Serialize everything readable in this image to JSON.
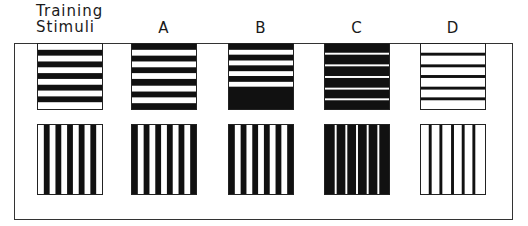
{
  "figure": {
    "column_labels": [
      {
        "id": "training",
        "line1": "Training",
        "line2": "Stimuli"
      },
      {
        "id": "A",
        "text": "A"
      },
      {
        "id": "B",
        "text": "B"
      },
      {
        "id": "C",
        "text": "C"
      },
      {
        "id": "D",
        "text": "D"
      }
    ],
    "rows": [
      "horizontal gratings",
      "vertical gratings"
    ],
    "stimuli": [
      {
        "column": "Training Stimuli",
        "description": "equal-width black/white bars (square wave)",
        "bar_width_ratio_black": 0.5,
        "cycles": 5,
        "horizontal_first_stripe": "white"
      },
      {
        "column": "A",
        "description": "equal bars, phase shifted (starts black)",
        "bar_width_ratio_black": 0.5,
        "cycles": 5,
        "horizontal_first_stripe": "black"
      },
      {
        "column": "B",
        "description": "bars with large black block at end",
        "cycles": 4,
        "horizontal_first_stripe": "black"
      },
      {
        "column": "C",
        "description": "mostly black with thin white lines",
        "bar_width_ratio_black": 0.88,
        "cycles": 5
      },
      {
        "column": "D",
        "description": "mostly white with thin black lines",
        "bar_width_ratio_black": 0.15,
        "cycles": 5
      }
    ],
    "colors": {
      "ink": "#111111",
      "paper": "#ffffff",
      "frame": "#333333"
    }
  }
}
